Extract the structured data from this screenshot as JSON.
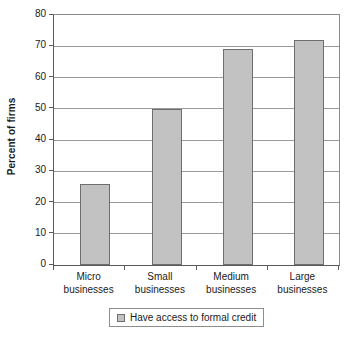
{
  "chart_data": {
    "type": "bar",
    "title": "",
    "subtitle": "",
    "xlabel": "",
    "ylabel": "Percent of firms",
    "categories": [
      "Micro businesses",
      "Small businesses",
      "Medium businesses",
      "Large businesses"
    ],
    "category_lines": [
      [
        "Micro",
        "businesses"
      ],
      [
        "Small",
        "businesses"
      ],
      [
        "Medium",
        "businesses"
      ],
      [
        "Large",
        "businesses"
      ]
    ],
    "series": [
      {
        "name": "Have access to formal credit",
        "values": [
          26,
          50,
          69,
          72
        ]
      }
    ],
    "values": [
      26,
      50,
      69,
      72
    ],
    "ylim": [
      0,
      80
    ],
    "ytick_step": 10,
    "ytick_labels": [
      "80",
      "70",
      "60",
      "50",
      "40",
      "30",
      "20",
      "10",
      "0"
    ],
    "ytick_values": [
      80,
      70,
      60,
      50,
      40,
      30,
      20,
      10,
      0
    ],
    "grid": true,
    "grid_axis": "y",
    "legend_position": "bottom",
    "legend_entries": [
      "Have access to formal credit"
    ],
    "annotations": [],
    "colors": {
      "bar_fill": "#c2c2c2",
      "bar_border": "#6e6e6e",
      "grid": "#9a9a9a",
      "axis": "#5a5a5a",
      "text": "#1a1a1a",
      "background": "#ffffff"
    }
  },
  "axis": {
    "y_title": "Percent of firms"
  },
  "legend": {
    "label": "Have access to formal credit"
  }
}
